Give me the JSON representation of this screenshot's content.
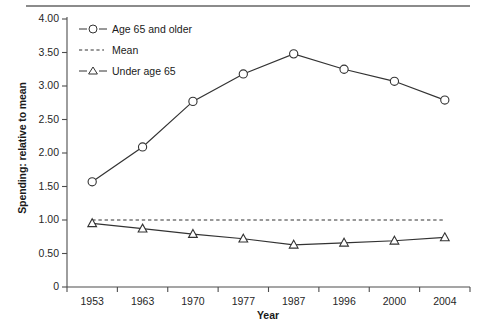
{
  "chart_data": {
    "type": "line",
    "title": "",
    "xlabel": "Year",
    "ylabel": "Spending: relative to mean",
    "categories": [
      "1953",
      "1963",
      "1970",
      "1977",
      "1987",
      "1996",
      "2000",
      "2004"
    ],
    "ylim": [
      0,
      4.0
    ],
    "yticks": [
      "0",
      "0.50",
      "1.00",
      "1.50",
      "2.00",
      "2.50",
      "3.00",
      "3.50",
      "4.00"
    ],
    "ytick_values": [
      0,
      0.5,
      1.0,
      1.5,
      2.0,
      2.5,
      3.0,
      3.5,
      4.0
    ],
    "grid": false,
    "legend_position": "top-left",
    "series": [
      {
        "name": "Age 65 and older",
        "marker": "circle",
        "style": "solid",
        "color": "#333333",
        "values": [
          1.57,
          2.09,
          2.77,
          3.18,
          3.48,
          3.25,
          3.07,
          2.79
        ]
      },
      {
        "name": "Mean",
        "marker": "none",
        "style": "dashed",
        "color": "#333333",
        "values": [
          1.0,
          1.0,
          1.0,
          1.0,
          1.0,
          1.0,
          1.0,
          1.0
        ]
      },
      {
        "name": "Under age 65",
        "marker": "triangle",
        "style": "solid",
        "color": "#333333",
        "values": [
          0.95,
          0.87,
          0.79,
          0.72,
          0.63,
          0.66,
          0.69,
          0.74
        ]
      }
    ]
  },
  "legend": {
    "items": [
      {
        "label": "Age 65 and older",
        "marker": "circle-marker"
      },
      {
        "label": "Mean",
        "marker": "dashed-line-marker"
      },
      {
        "label": "Under age 65",
        "marker": "triangle-marker"
      }
    ]
  },
  "axes": {
    "x_title": "Year",
    "y_title": "Spending: relative to mean"
  }
}
